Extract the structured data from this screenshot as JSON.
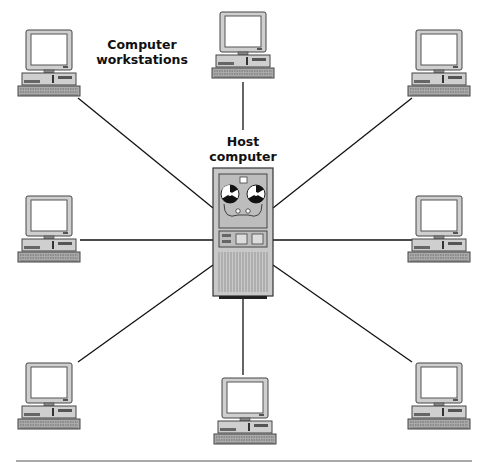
{
  "diagram": {
    "type": "star-network",
    "labels": {
      "workstations": "Computer workstations",
      "workstations_line1": "Computer",
      "workstations_line2": "workstations",
      "host_line1": "Host",
      "host_line2": "computer"
    },
    "colors": {
      "line": "#111111",
      "case": "#c8c8c8",
      "screen": "#ffffff",
      "outline": "#444444"
    },
    "nodes": [
      {
        "id": "workstation-top-left"
      },
      {
        "id": "workstation-top-center"
      },
      {
        "id": "workstation-top-right"
      },
      {
        "id": "workstation-middle-left"
      },
      {
        "id": "workstation-middle-right"
      },
      {
        "id": "workstation-bottom-left"
      },
      {
        "id": "workstation-bottom-center"
      },
      {
        "id": "workstation-bottom-right"
      },
      {
        "id": "host-computer"
      }
    ]
  }
}
